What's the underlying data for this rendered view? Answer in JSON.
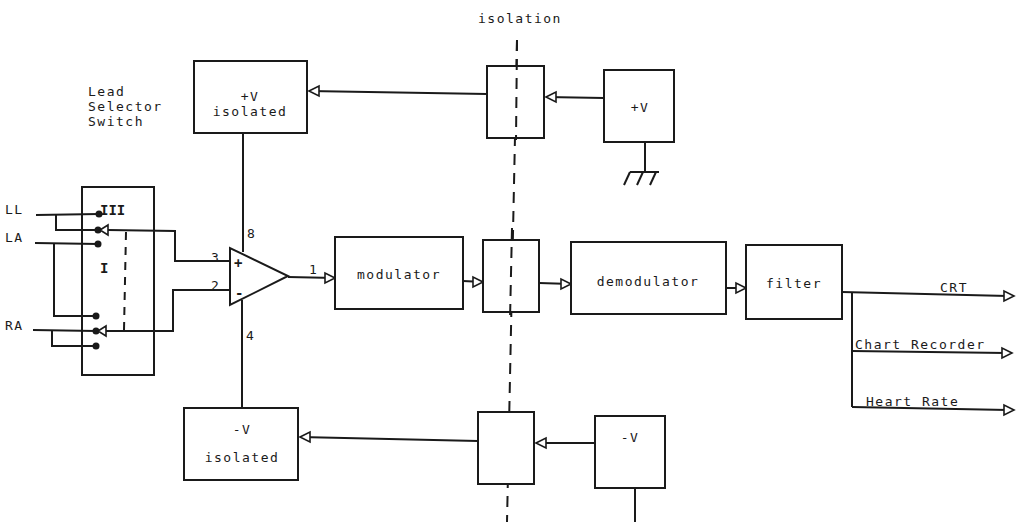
{
  "diagram": {
    "isolation_label": "isolation",
    "lead_selector": {
      "label_line1": "Lead",
      "label_line2": "Selector",
      "label_line3": "Switch",
      "inputs": [
        "LL",
        "LA",
        "RA"
      ],
      "positions": [
        "III",
        "I"
      ]
    },
    "op_amp": {
      "plus": "+",
      "minus": "-",
      "pins": {
        "noninverting": "3",
        "inverting": "2",
        "supply_pos": "8",
        "supply_neg": "4",
        "output": "1"
      }
    },
    "blocks": {
      "pos_isolated_line1": "+V",
      "pos_isolated_line2": "isolated",
      "neg_isolated_line1": "-V",
      "neg_isolated_line2": "isolated",
      "pos_supply": "+V",
      "neg_supply": "-V",
      "modulator": "modulator",
      "demodulator": "demodulator",
      "filter": "filter"
    },
    "outputs": [
      "CRT",
      "Chart Recorder",
      "Heart Rate"
    ]
  }
}
